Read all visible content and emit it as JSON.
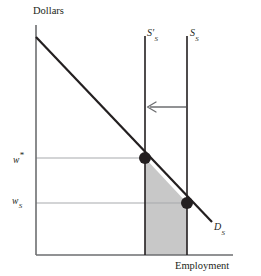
{
  "figure": {
    "background_color": "#ffffff",
    "width": 261,
    "height": 276
  },
  "axes": {
    "y_axis_title": "Dollars",
    "x_axis_title": "Employment",
    "axis_color": "#6d6e70",
    "origin_x": 36,
    "origin_y": 255,
    "y_top": 25,
    "x_right": 233
  },
  "tick_labels": {
    "y": [
      {
        "base": "w",
        "superscript": "*",
        "subscript": "",
        "value_y": 158
      },
      {
        "base": "w",
        "superscript": "",
        "subscript": "S",
        "value_y": 203
      }
    ]
  },
  "curve_labels": {
    "demand": {
      "base": "D",
      "subscript": "S"
    },
    "supply_new": {
      "base": "S",
      "prime": "′",
      "subscript": "S"
    },
    "supply_old": {
      "base": "S",
      "prime": "",
      "subscript": "S"
    }
  },
  "annotations": {
    "shift_arrow": {
      "name": "leftward-shift-arrow",
      "direction": "left",
      "from_x": 187,
      "to_x": 146,
      "y": 107,
      "color": "#6d6e70"
    },
    "shaded_region": {
      "name": "welfare-loss-region",
      "fill_color": "#c8c8c8",
      "stroke_color": "#58595b"
    }
  },
  "chart_data": {
    "type": "line",
    "title": "",
    "xlabel": "Employment",
    "ylabel": "Dollars",
    "grid": true,
    "legend_position": "inline-curve-labels",
    "xlim": [
      36,
      233
    ],
    "ylim": [
      255,
      25
    ],
    "series": [
      {
        "name": "D_S",
        "label": "Demand for labor",
        "type": "line",
        "color": "#231f20",
        "linewidth": 2.2,
        "points": [
          [
            36,
            37
          ],
          [
            212,
            222
          ]
        ]
      },
      {
        "name": "S'_S",
        "label": "New labor supply (restricted)",
        "type": "vline",
        "color": "#231f20",
        "linewidth": 1.6,
        "x": 145,
        "y_from": 36,
        "y_to": 255
      },
      {
        "name": "S_S",
        "label": "Original labor supply",
        "type": "vline",
        "color": "#231f20",
        "linewidth": 1.6,
        "x": 187,
        "y_from": 36,
        "y_to": 255
      }
    ],
    "markers": [
      {
        "name": "new-equilibrium-point",
        "x": 145,
        "y": 158,
        "radius": 6.0,
        "color": "#231f20"
      },
      {
        "name": "old-equilibrium-point",
        "x": 187,
        "y": 203,
        "radius": 6.0,
        "color": "#231f20"
      }
    ],
    "gridlines": [
      {
        "name": "w-star-gridline",
        "orientation": "horizontal",
        "y": 158,
        "x_from": 36,
        "x_to": 145,
        "color": "#a7a9ac"
      },
      {
        "name": "w-s-gridline",
        "orientation": "horizontal",
        "y": 203,
        "x_from": 36,
        "x_to": 187,
        "color": "#a7a9ac"
      }
    ],
    "shaded_polygon": {
      "name": "deadweight-area",
      "points": [
        [
          145,
          158
        ],
        [
          187,
          203
        ],
        [
          187,
          255
        ],
        [
          145,
          255
        ]
      ],
      "fill": "#c8c8c8"
    },
    "annotations": [
      {
        "text": "←",
        "meaning": "supply shifts left",
        "x": 166,
        "y": 107
      }
    ]
  }
}
